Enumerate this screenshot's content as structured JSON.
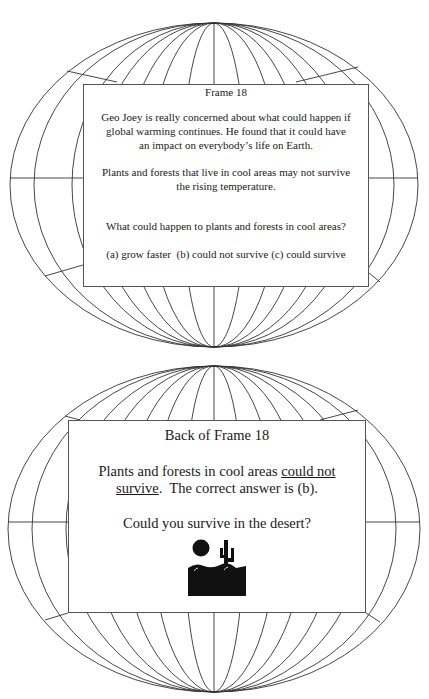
{
  "front": {
    "title": "Frame 18",
    "para1": [
      "Geo Joey is really concerned about what could happen if",
      "global warming continues.  He found that it could have",
      "an impact on everybody’s life on Earth."
    ],
    "para2": [
      "Plants and forests that live in cool areas may not survive",
      "the rising temperature."
    ],
    "question": "What could happen to plants and forests in cool areas?",
    "options": "(a) grow faster  (b) could not survive (c) could survive"
  },
  "back": {
    "title": "Back of Frame 18",
    "answer_prefix": "Plants and forests in cool areas ",
    "answer_underline_1": "could not",
    "answer_underline_2": "survive",
    "answer_suffix": ".  The correct answer is (b).",
    "question": "Could you survive in the desert?",
    "icon": "desert-sun-cactus-icon"
  },
  "colors": {
    "line": "#333333",
    "background": "#ffffff",
    "icon": "#111111"
  }
}
